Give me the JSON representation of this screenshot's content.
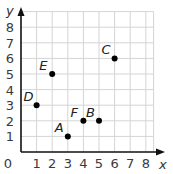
{
  "graph": {
    "x_axis_label": "x",
    "y_axis_label": "y",
    "x_ticks": [
      "0",
      "1",
      "2",
      "3",
      "4",
      "5",
      "6",
      "7",
      "8"
    ],
    "y_ticks": [
      "1",
      "2",
      "3",
      "4",
      "5",
      "6",
      "7",
      "8"
    ],
    "x_range": [
      0,
      8.5
    ],
    "y_range": [
      0,
      9
    ],
    "grid": true,
    "colors": {
      "grid": "#d4d4d4",
      "axis": "#111111",
      "point": "#000000"
    },
    "points": [
      {
        "label": "A",
        "x": 3,
        "y": 1
      },
      {
        "label": "B",
        "x": 5,
        "y": 2
      },
      {
        "label": "C",
        "x": 6,
        "y": 6
      },
      {
        "label": "D",
        "x": 1,
        "y": 3
      },
      {
        "label": "E",
        "x": 2,
        "y": 5
      },
      {
        "label": "F",
        "x": 4,
        "y": 2
      }
    ]
  }
}
